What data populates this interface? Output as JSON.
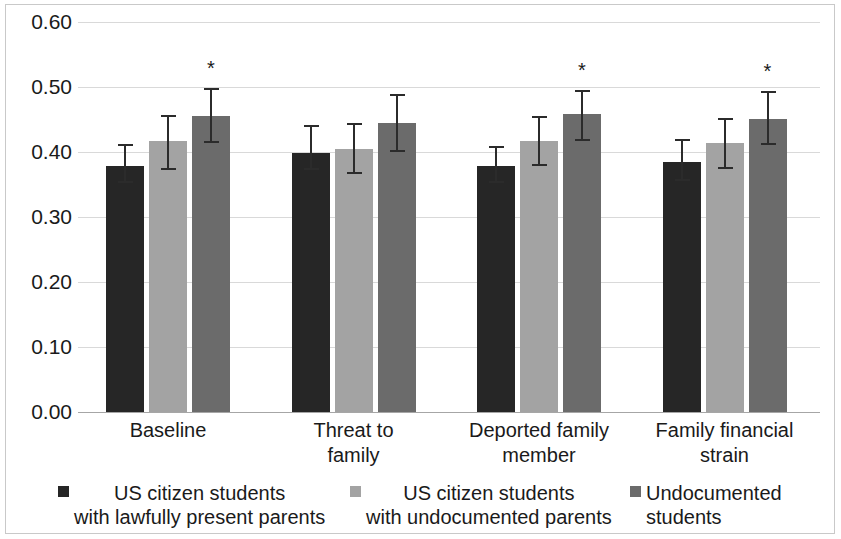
{
  "chart_data": {
    "type": "bar",
    "title": "",
    "subtitle": "",
    "xlabel": "",
    "ylabel": "",
    "ylim": [
      0.0,
      0.6
    ],
    "ytick_labels": [
      "0.60",
      "0.50",
      "0.40",
      "0.30",
      "0.20",
      "0.10",
      "0.00"
    ],
    "ytick_values": [
      0.6,
      0.5,
      0.4,
      0.3,
      0.2,
      0.1,
      0.0
    ],
    "grid": true,
    "legend_position": "bottom",
    "categories": [
      "Baseline",
      "Threat to\nfamily",
      "Deported family\nmember",
      "Family financial\nstrain"
    ],
    "series": [
      {
        "name": "US citizen students\nwith lawfully present parents",
        "color": "#262626",
        "values": [
          0.378,
          0.399,
          0.378,
          0.385
        ],
        "err_low": [
          0.352,
          0.372,
          0.352,
          0.356
        ],
        "err_high": [
          0.412,
          0.441,
          0.41,
          0.42
        ],
        "significance": [
          "",
          "",
          "",
          ""
        ]
      },
      {
        "name": "US citizen students\nwith undocumented parents",
        "color": "#a3a3a3",
        "values": [
          0.417,
          0.405,
          0.417,
          0.414
        ],
        "err_low": [
          0.373,
          0.366,
          0.378,
          0.374
        ],
        "err_high": [
          0.457,
          0.444,
          0.455,
          0.452
        ],
        "significance": [
          "",
          "",
          "",
          ""
        ]
      },
      {
        "name": "Undocumented\nstudents",
        "color": "#6b6b6b",
        "values": [
          0.456,
          0.445,
          0.458,
          0.451
        ],
        "err_low": [
          0.414,
          0.4,
          0.417,
          0.41
        ],
        "err_high": [
          0.498,
          0.49,
          0.496,
          0.494
        ],
        "significance": [
          "*",
          "",
          "*",
          "*"
        ]
      }
    ]
  },
  "legend": {
    "items": [
      {
        "label": "US citizen students\nwith lawfully present parents",
        "color": "#262626"
      },
      {
        "label": "US citizen students\nwith undocumented parents",
        "color": "#a3a3a3"
      },
      {
        "label": "Undocumented\nstudents",
        "color": "#6b6b6b"
      }
    ]
  }
}
